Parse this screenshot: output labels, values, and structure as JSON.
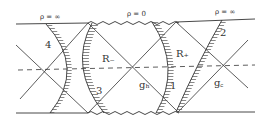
{
  "diagram": {
    "type": "penrose-diagram",
    "boundary_labels": {
      "top_left": "ρ = ∞",
      "top_middle": "ρ = 0",
      "top_right": "ρ = ∞"
    },
    "region_labels": {
      "r_minus": "R₋",
      "r_plus": "R₊",
      "g_h": "gₕ",
      "g_c": "g꜀"
    },
    "curve_labels": {
      "curve_1": "1",
      "curve_2": "2",
      "curve_3": "3",
      "curve_4": "4"
    },
    "colors": {
      "ink": "#333333",
      "background": "#ffffff"
    }
  }
}
